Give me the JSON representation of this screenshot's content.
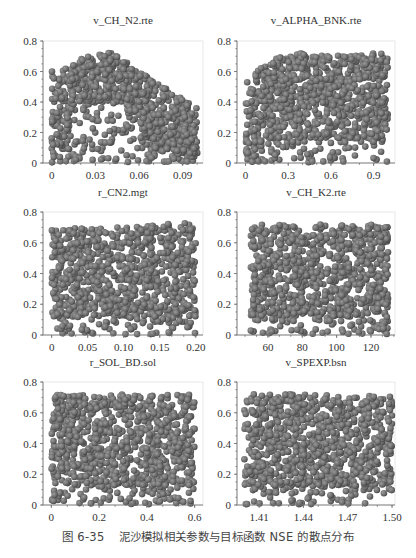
{
  "figure": {
    "caption_number": "图 6-35",
    "caption_text": "泥沙模拟相关参数与目标函数 NSE 的散点分布",
    "point_color": "#6b6b6b",
    "point_highlight": "#9a9a9a",
    "point_edge": "#4a4a4a"
  },
  "chart_data": [
    {
      "type": "scatter",
      "title": "v_CH_N2.rte",
      "xlabel": "",
      "ylabel": "NSE",
      "xlim": [
        -0.006,
        0.104
      ],
      "ylim": [
        0,
        0.8
      ],
      "xticks": [
        0,
        0.03,
        0.06,
        0.09
      ],
      "xtick_labels": [
        "0",
        "0.03",
        "0.06",
        "0.09"
      ],
      "yticks": [
        0,
        0.2,
        0.4,
        0.6,
        0.8
      ],
      "ytick_labels": [
        "0",
        "0.2",
        "0.4",
        "0.6",
        "0.8"
      ],
      "x_range": [
        0,
        0.1
      ],
      "n_points": 900,
      "pattern": "arch: NSE upper envelope rises from ~0.6 at x=0 to peak ~0.73 near x=0.04 then falls to ~0.35 at x=0.1; sparse low-NSE points in hollow below",
      "envelope": [
        [
          0,
          0.6
        ],
        [
          0.01,
          0.62
        ],
        [
          0.02,
          0.69
        ],
        [
          0.03,
          0.71
        ],
        [
          0.04,
          0.73
        ],
        [
          0.05,
          0.68
        ],
        [
          0.06,
          0.6
        ],
        [
          0.07,
          0.55
        ],
        [
          0.08,
          0.48
        ],
        [
          0.09,
          0.42
        ],
        [
          0.1,
          0.36
        ]
      ]
    },
    {
      "type": "scatter",
      "title": "v_ALPHA_BNK.rte",
      "xlabel": "",
      "ylabel": "NSE",
      "xlim": [
        -0.06,
        1.05
      ],
      "ylim": [
        0,
        0.8
      ],
      "xticks": [
        0,
        0.3,
        0.6,
        0.9
      ],
      "xtick_labels": [
        "0",
        "0.3",
        "0.6",
        "0.9"
      ],
      "yticks": [
        0,
        0.2,
        0.4,
        0.6,
        0.8
      ],
      "ytick_labels": [
        "0",
        "0.2",
        "0.4",
        "0.6",
        "0.8"
      ],
      "x_range": [
        0,
        1.0
      ],
      "n_points": 900,
      "pattern": "increasing: upper envelope ~0.55 at x=0 rising to ~0.72 for x>0.2; dense cloud 0.2-0.72",
      "envelope": [
        [
          0,
          0.55
        ],
        [
          0.1,
          0.62
        ],
        [
          0.2,
          0.68
        ],
        [
          0.3,
          0.72
        ],
        [
          0.6,
          0.72
        ],
        [
          1.0,
          0.72
        ]
      ]
    },
    {
      "type": "scatter",
      "title": "r_CN2.mgt",
      "xlabel": "",
      "ylabel": "NSE",
      "xlim": [
        -0.012,
        0.21
      ],
      "ylim": [
        0,
        0.8
      ],
      "xticks": [
        0,
        0.05,
        0.1,
        0.15,
        0.2
      ],
      "xtick_labels": [
        "0",
        "0.05",
        "0.10",
        "0.15",
        "0.20"
      ],
      "yticks": [
        0,
        0.2,
        0.4,
        0.6,
        0.8
      ],
      "ytick_labels": [
        "0",
        "0.2",
        "0.4",
        "0.6",
        "0.8"
      ],
      "x_range": [
        0,
        0.2
      ],
      "n_points": 900,
      "pattern": "uniform: points spread evenly 0-0.72 across x",
      "envelope": [
        [
          0,
          0.69
        ],
        [
          0.2,
          0.73
        ]
      ]
    },
    {
      "type": "scatter",
      "title": "v_CH_K2.rte",
      "xlabel": "",
      "ylabel": "NSE",
      "xlim": [
        42,
        134
      ],
      "ylim": [
        0,
        0.8
      ],
      "xticks": [
        60,
        80,
        100,
        120
      ],
      "xtick_labels": [
        "60",
        "80",
        "100",
        "120"
      ],
      "yticks": [
        0,
        0.2,
        0.4,
        0.6,
        0.8
      ],
      "ytick_labels": [
        "0",
        "0.2",
        "0.4",
        "0.6",
        "0.8"
      ],
      "x_range": [
        50,
        130
      ],
      "n_points": 900,
      "pattern": "uniform: points spread evenly 0-0.73 across x",
      "envelope": [
        [
          50,
          0.72
        ],
        [
          130,
          0.72
        ]
      ]
    },
    {
      "type": "scatter",
      "title": "r_SOL_BD.sol",
      "xlabel": "",
      "ylabel": "NSE",
      "xlim": [
        -0.035,
        0.635
      ],
      "ylim": [
        0,
        0.8
      ],
      "xticks": [
        0,
        0.2,
        0.4,
        0.6
      ],
      "xtick_labels": [
        "0",
        "0.2",
        "0.4",
        "0.6"
      ],
      "yticks": [
        0,
        0.2,
        0.4,
        0.6,
        0.8
      ],
      "ytick_labels": [
        "0",
        "0.2",
        "0.4",
        "0.6",
        "0.8"
      ],
      "x_range": [
        0,
        0.6
      ],
      "n_points": 900,
      "pattern": "uniform: points spread evenly 0-0.73 across x",
      "envelope": [
        [
          0,
          0.72
        ],
        [
          0.6,
          0.72
        ]
      ]
    },
    {
      "type": "scatter",
      "title": "v_SPEXP.bsn",
      "xlabel": "",
      "ylabel": "NSE",
      "xlim": [
        1.395,
        1.502
      ],
      "ylim": [
        0,
        0.8
      ],
      "xticks": [
        1.41,
        1.44,
        1.47,
        1.5
      ],
      "xtick_labels": [
        "1.41",
        "1.44",
        "1.47",
        "1.50"
      ],
      "yticks": [
        0,
        0.2,
        0.4,
        0.6,
        0.8
      ],
      "ytick_labels": [
        "0",
        "0.2",
        "0.4",
        "0.6",
        "0.8"
      ],
      "x_range": [
        1.4,
        1.5
      ],
      "n_points": 900,
      "pattern": "uniform: points spread evenly 0-0.73 across x",
      "envelope": [
        [
          1.4,
          0.72
        ],
        [
          1.5,
          0.72
        ]
      ]
    }
  ]
}
